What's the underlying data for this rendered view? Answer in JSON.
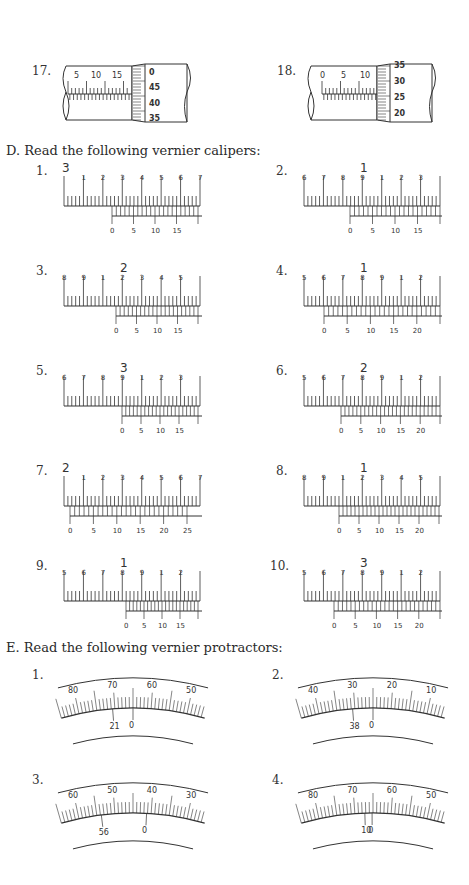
{
  "micrometers": [
    {
      "number": "17.",
      "sleeve_labels": [
        "5",
        "10",
        "15"
      ],
      "thimble_labels": [
        "0",
        "45",
        "40",
        "35"
      ]
    },
    {
      "number": "18.",
      "sleeve_labels": [
        "0",
        "5",
        "10"
      ],
      "thimble_labels": [
        "35",
        "30",
        "25",
        "20"
      ]
    }
  ],
  "section_d": {
    "heading": "D.  Read the following vernier calipers:",
    "items": [
      {
        "number": "1.",
        "big": "3",
        "main_labels": [
          "1",
          "2",
          "3",
          "4",
          "5",
          "6",
          "7"
        ],
        "vernier_labels": [
          "0",
          "5",
          "10",
          "15"
        ]
      },
      {
        "number": "2.",
        "big": "1",
        "main_labels": [
          "6",
          "7",
          "8",
          "9",
          "1",
          "2",
          "3"
        ],
        "vernier_labels": [
          "0",
          "5",
          "10",
          "15"
        ]
      },
      {
        "number": "3.",
        "big": "2",
        "main_labels": [
          "8",
          "9",
          "1",
          "2",
          "3",
          "4",
          "5"
        ],
        "vernier_labels": [
          "0",
          "5",
          "10",
          "15"
        ]
      },
      {
        "number": "4.",
        "big": "1",
        "main_labels": [
          "5",
          "6",
          "7",
          "8",
          "9",
          "1",
          "2"
        ],
        "vernier_labels": [
          "0",
          "5",
          "10",
          "15",
          "20"
        ]
      },
      {
        "number": "5.",
        "big": "3",
        "main_labels": [
          "6",
          "7",
          "8",
          "9",
          "1",
          "2",
          "3"
        ],
        "vernier_labels": [
          "0",
          "5",
          "10",
          "15"
        ]
      },
      {
        "number": "6.",
        "big": "2",
        "main_labels": [
          "5",
          "6",
          "7",
          "8",
          "9",
          "1",
          "2"
        ],
        "vernier_labels": [
          "0",
          "5",
          "10",
          "15",
          "20"
        ]
      },
      {
        "number": "7.",
        "big": "2",
        "main_labels": [
          "1",
          "2",
          "3",
          "4",
          "5",
          "6",
          "7"
        ],
        "vernier_labels": [
          "0",
          "5",
          "10",
          "15",
          "20",
          "25"
        ]
      },
      {
        "number": "8.",
        "big": "1",
        "main_labels": [
          "8",
          "9",
          "1",
          "2",
          "3",
          "4",
          "5"
        ],
        "vernier_labels": [
          "0",
          "5",
          "10",
          "15",
          "20"
        ]
      },
      {
        "number": "9.",
        "big": "1",
        "main_labels": [
          "5",
          "6",
          "7",
          "8",
          "9",
          "1",
          "2"
        ],
        "vernier_labels": [
          "0",
          "5",
          "10",
          "15"
        ]
      },
      {
        "number": "10.",
        "big": "3",
        "main_labels": [
          "5",
          "6",
          "7",
          "8",
          "9",
          "1",
          "2"
        ],
        "vernier_labels": [
          "0",
          "5",
          "10",
          "15",
          "20"
        ]
      }
    ]
  },
  "section_e": {
    "heading": "E.  Read the following vernier protractors:",
    "items": [
      {
        "number": "1.",
        "scale_labels": [
          "80",
          "70",
          "60",
          "50"
        ],
        "vernier_labels": [
          "21",
          "0"
        ]
      },
      {
        "number": "2.",
        "scale_labels": [
          "40",
          "30",
          "20",
          "10"
        ],
        "vernier_labels": [
          "38",
          "0"
        ]
      },
      {
        "number": "3.",
        "scale_labels": [
          "60",
          "50",
          "40",
          "30"
        ],
        "vernier_labels": [
          "56",
          "0"
        ]
      },
      {
        "number": "4.",
        "scale_labels": [
          "80",
          "70",
          "60",
          "50"
        ],
        "vernier_labels": [
          "10",
          "0"
        ]
      }
    ]
  }
}
